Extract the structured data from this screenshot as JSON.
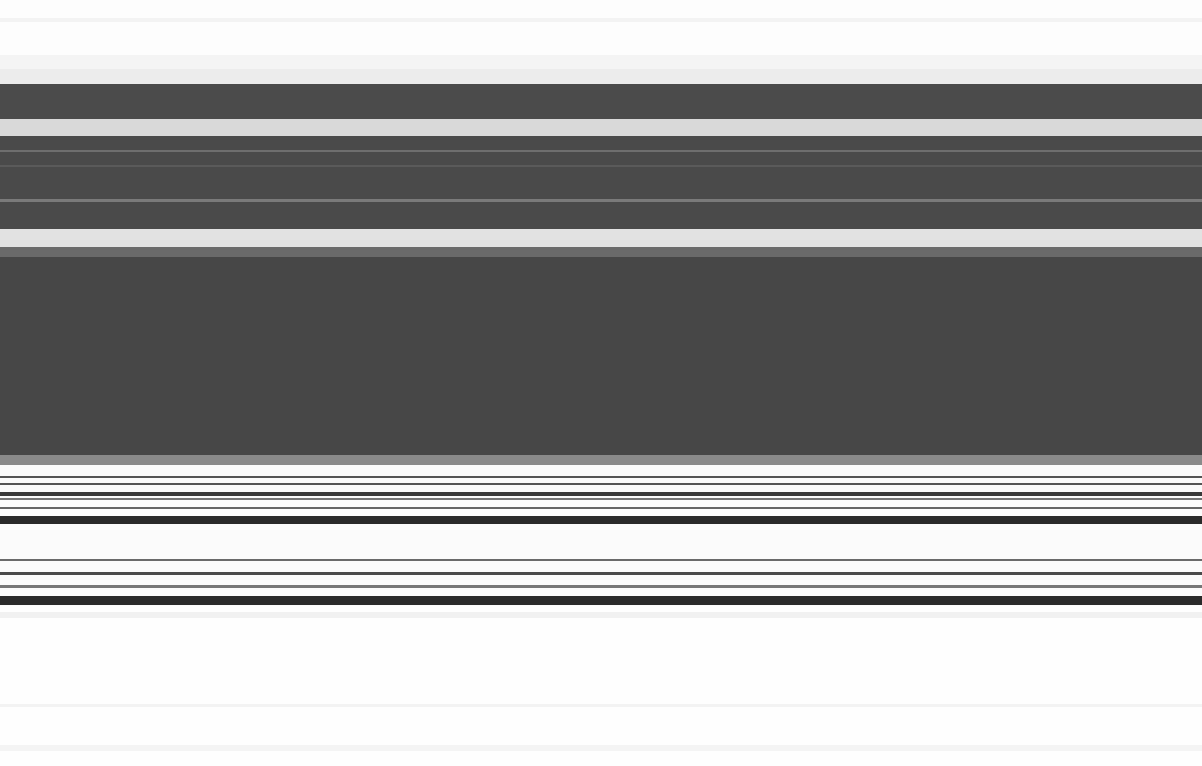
{
  "image_state": {
    "description": "Screenshot content is not legible: the image consists only of horizontal gray/black streaks with no readable text, icons, or UI controls.",
    "legible_text": []
  },
  "bands": [
    {
      "top": 0,
      "height": 55,
      "color": "#fdfdfd"
    },
    {
      "top": 18,
      "height": 4,
      "color": "#f3f3f3"
    },
    {
      "top": 55,
      "height": 14,
      "color": "#f4f4f4"
    },
    {
      "top": 69,
      "height": 15,
      "color": "#ececec"
    },
    {
      "top": 84,
      "height": 35,
      "color": "#4b4b4b"
    },
    {
      "top": 119,
      "height": 17,
      "color": "#d9d9d9"
    },
    {
      "top": 136,
      "height": 93,
      "color": "#4a4a4a"
    },
    {
      "top": 150,
      "height": 2,
      "color": "#6e6e6e"
    },
    {
      "top": 165,
      "height": 2,
      "color": "#5a5a5a"
    },
    {
      "top": 199,
      "height": 3,
      "color": "#7a7a7a"
    },
    {
      "top": 229,
      "height": 18,
      "color": "#e2e2e2"
    },
    {
      "top": 247,
      "height": 10,
      "color": "#6a6a6a"
    },
    {
      "top": 257,
      "height": 198,
      "color": "#474747"
    },
    {
      "top": 455,
      "height": 10,
      "color": "#8a8a8a"
    },
    {
      "top": 465,
      "height": 141,
      "color": "#fbfbfb"
    },
    {
      "top": 476,
      "height": 2,
      "color": "#555555"
    },
    {
      "top": 483,
      "height": 2,
      "color": "#555555"
    },
    {
      "top": 492,
      "height": 4,
      "color": "#3a3a3a"
    },
    {
      "top": 498,
      "height": 2,
      "color": "#777777"
    },
    {
      "top": 507,
      "height": 2,
      "color": "#666666"
    },
    {
      "top": 516,
      "height": 8,
      "color": "#2a2a2a"
    },
    {
      "top": 559,
      "height": 2,
      "color": "#6a6a6a"
    },
    {
      "top": 572,
      "height": 3,
      "color": "#4a4a4a"
    },
    {
      "top": 585,
      "height": 3,
      "color": "#777777"
    },
    {
      "top": 596,
      "height": 9,
      "color": "#2a2a2a"
    },
    {
      "top": 606,
      "height": 160,
      "color": "#fefefe"
    },
    {
      "top": 612,
      "height": 6,
      "color": "#f1f1f1"
    },
    {
      "top": 704,
      "height": 3,
      "color": "#f3f3f3"
    },
    {
      "top": 745,
      "height": 6,
      "color": "#f4f4f4"
    }
  ]
}
